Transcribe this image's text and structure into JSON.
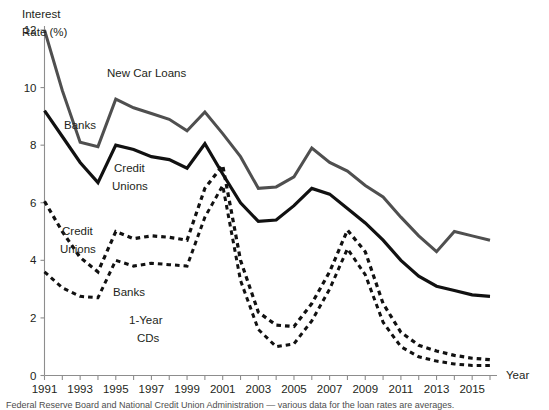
{
  "chart_data": {
    "type": "line",
    "title": "New Car Loans",
    "xlabel": "Year",
    "ylabel": "Interest Rate (%)",
    "ylabel_line1": "Interest",
    "ylabel_line2": "Rate (%)",
    "xlim": [
      1991,
      2016
    ],
    "ylim": [
      0,
      12
    ],
    "yticks": [
      0,
      2,
      4,
      6,
      8,
      10,
      12
    ],
    "yticklabels": [
      "0",
      "2",
      "4",
      "6",
      "8",
      "10",
      "12"
    ],
    "xticks": [
      1991,
      1993,
      1995,
      1997,
      1999,
      2001,
      2003,
      2005,
      2007,
      2009,
      2011,
      2013,
      2015
    ],
    "xticklabels": [
      "1991",
      "1993",
      "1995",
      "1997",
      "1999",
      "2001",
      "2003",
      "2005",
      "2007",
      "2009",
      "2011",
      "2013",
      "2015"
    ],
    "x": [
      1991,
      1992,
      1993,
      1994,
      1995,
      1996,
      1997,
      1998,
      1999,
      2000,
      2001,
      2002,
      2003,
      2004,
      2005,
      2006,
      2007,
      2008,
      2009,
      2010,
      2011,
      2012,
      2013,
      2014,
      2015,
      2016
    ],
    "grid": false,
    "legend_position": "inline-labels",
    "series": [
      {
        "name": "Banks",
        "group": "New Car Loans",
        "style": "solid",
        "color": "#4f4f4f",
        "width": 3.0,
        "label": "Banks",
        "values": [
          12.0,
          9.9,
          8.1,
          7.95,
          9.6,
          9.3,
          9.1,
          8.9,
          8.5,
          9.15,
          8.4,
          7.6,
          6.5,
          6.55,
          6.9,
          7.9,
          7.4,
          7.1,
          6.6,
          6.2,
          5.5,
          4.85,
          4.3,
          5.0,
          4.85,
          4.7
        ]
      },
      {
        "name": "Credit Unions",
        "group": "New Car Loans",
        "style": "solid",
        "color": "#111111",
        "width": 3.2,
        "label": "Credit Unions",
        "values": [
          9.2,
          8.3,
          7.4,
          6.7,
          8.0,
          7.85,
          7.6,
          7.5,
          7.2,
          8.05,
          7.0,
          6.0,
          5.35,
          5.4,
          5.9,
          6.5,
          6.3,
          5.8,
          5.3,
          4.7,
          4.0,
          3.45,
          3.1,
          2.95,
          2.8,
          2.75
        ]
      },
      {
        "name": "Credit Unions",
        "group": "1-Year CDs",
        "style": "dashed",
        "color": "#111111",
        "width": 3.2,
        "label": "Credit Unions",
        "values": [
          6.05,
          5.0,
          4.1,
          3.6,
          5.0,
          4.75,
          4.85,
          4.8,
          4.7,
          6.5,
          7.3,
          4.0,
          2.2,
          1.75,
          1.7,
          2.5,
          3.6,
          5.05,
          4.3,
          2.5,
          1.5,
          1.05,
          0.85,
          0.7,
          0.6,
          0.55
        ]
      },
      {
        "name": "Banks",
        "group": "1-Year CDs",
        "style": "dashed",
        "color": "#111111",
        "width": 3.0,
        "label": "Banks",
        "values": [
          3.6,
          3.05,
          2.75,
          2.7,
          4.0,
          3.8,
          3.9,
          3.85,
          3.8,
          5.5,
          6.6,
          3.3,
          1.6,
          1.0,
          1.1,
          1.9,
          3.0,
          4.4,
          3.5,
          1.85,
          1.0,
          0.65,
          0.5,
          0.4,
          0.35,
          0.35
        ]
      }
    ],
    "annotations": [
      {
        "id": "title-new-car-loans",
        "text": "New Car Loans",
        "x": 107,
        "y": 77
      },
      {
        "id": "label-banks-upper",
        "text": "Banks",
        "x": 64,
        "y": 129
      },
      {
        "id": "label-credit-unions-upper-l1",
        "text": "Credit",
        "x": 114,
        "y": 172
      },
      {
        "id": "label-credit-unions-upper-l2",
        "text": "Unions",
        "x": 112,
        "y": 190
      },
      {
        "id": "label-credit-unions-lower-l1",
        "text": "Credit",
        "x": 62,
        "y": 235
      },
      {
        "id": "label-credit-unions-lower-l2",
        "text": "Unions",
        "x": 60,
        "y": 253
      },
      {
        "id": "label-banks-lower",
        "text": "Banks",
        "x": 113,
        "y": 296
      },
      {
        "id": "label-cds-l1",
        "text": "1-Year",
        "x": 129,
        "y": 324
      },
      {
        "id": "label-cds-l2",
        "text": "CDs",
        "x": 137,
        "y": 342
      }
    ],
    "source_note": "Federal Reserve Board and National Credit Union Administration — various data for the loan rates are averages."
  }
}
